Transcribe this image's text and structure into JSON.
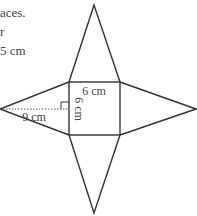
{
  "text_fragment": {
    "lines": [
      "aces.",
      "r",
      "5 cm"
    ]
  },
  "figure": {
    "type": "net of square pyramid",
    "square_side_label": "6 cm",
    "square_side_vertical_label": "6 cm",
    "slant_height_label": "9 cm",
    "line_color": "#333333"
  }
}
